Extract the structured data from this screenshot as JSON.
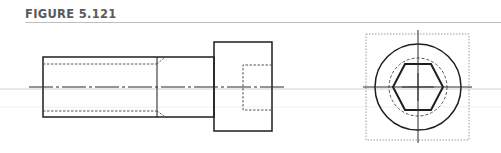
{
  "figure": {
    "label": "FIGURE 5.121"
  },
  "drawing": {
    "subject": "socket-head-cap-screw",
    "views": [
      "side-view",
      "end-view"
    ],
    "colors": {
      "line": "#1e1e1e",
      "hidden": "#555555",
      "phantom": "#9a9a9a",
      "rule": "#bdbdbd"
    }
  }
}
